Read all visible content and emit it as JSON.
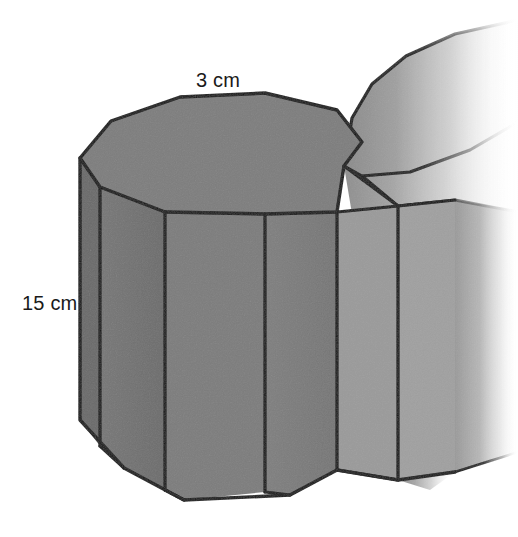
{
  "figure": {
    "shape_name": "decagonal-prism",
    "background_color": "#ffffff",
    "outline_color": "#141414"
  },
  "labels": {
    "top_edge": {
      "text": "3 cm",
      "value": 3,
      "unit": "cm",
      "refers_to": "top-face-edge-length",
      "x": 196,
      "y": 70
    },
    "height": {
      "text": "15 cm",
      "value": 15,
      "unit": "cm",
      "refers_to": "prism-height",
      "x": 22,
      "y": 293
    }
  },
  "colors": {
    "top_face": "#7c7c7c",
    "front_face_dark": "#6f6f6f",
    "front_face_mid": "#7a7a7a",
    "side_face_light": "#9a9a9a",
    "side_face_lighter": "#a8a8a8",
    "ghost_light": "#b4b4b4",
    "ghost_pale": "#d2d2d2",
    "stroke": "#141414",
    "text": "#1a1a1a"
  },
  "geometry": {
    "front_prism": {
      "top_face_points": "229,181 258,123 316,98 404,90 484,104 521,137 522,173 475,202 393,216 298,211",
      "bottom_outline_points": "229,181 229,440 258,482 298,507 393,511 475,495 522,464 522,173",
      "vertical_edge_x": [
        229,
        258,
        298,
        393,
        475,
        522
      ],
      "side_count": 10
    },
    "ghost_prism": {
      "visible": true,
      "fades_right": true
    }
  }
}
